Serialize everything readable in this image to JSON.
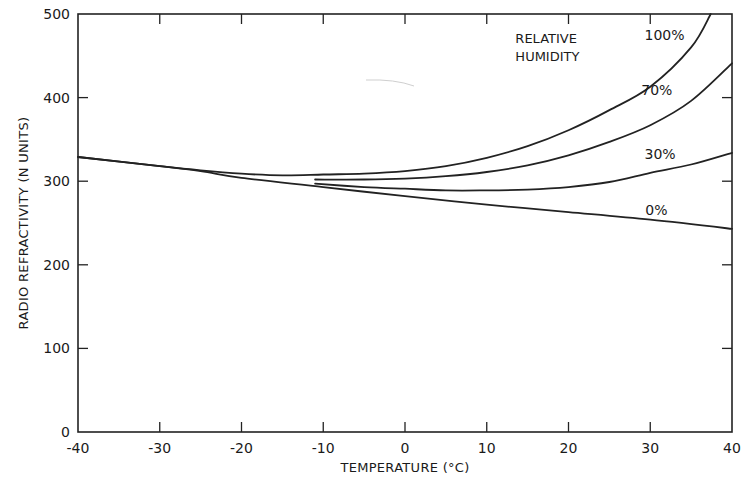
{
  "chart_data": {
    "type": "line",
    "title": "",
    "xlabel": "TEMPERATURE (°C)",
    "ylabel": "RADIO REFRACTIVITY (N UNITS)",
    "xlim": [
      -40,
      40
    ],
    "ylim": [
      0,
      500
    ],
    "x_ticks": [
      -40,
      -30,
      -20,
      -10,
      0,
      10,
      20,
      30,
      40
    ],
    "x_tick_labels": [
      "-40",
      "-30",
      "-20",
      "-10",
      "0",
      "10",
      "20",
      "30",
      "40"
    ],
    "y_ticks": [
      0,
      100,
      200,
      300,
      400,
      500
    ],
    "y_tick_labels": [
      "0",
      "100",
      "200",
      "300",
      "400",
      "500"
    ],
    "grid": false,
    "legend": {
      "title": "RELATIVE HUMIDITY",
      "title_lines": [
        "RELATIVE",
        "HUMIDITY"
      ],
      "position": "inline labels near curve ends (upper right)"
    },
    "series": [
      {
        "name": "100%",
        "label": "100%",
        "x": [
          -40,
          -30,
          -25,
          -20,
          -15,
          -10,
          -5,
          0,
          5,
          10,
          15,
          20,
          25,
          30,
          35,
          37.4
        ],
        "y": [
          329,
          318,
          313,
          309,
          307,
          308,
          309,
          312,
          318,
          328,
          342,
          361,
          385,
          413,
          460,
          500
        ]
      },
      {
        "name": "70%",
        "label": "70%",
        "x": [
          -11,
          -5,
          0,
          5,
          10,
          15,
          20,
          25,
          30,
          35,
          40
        ],
        "y": [
          302,
          302,
          303,
          306,
          311,
          319,
          331,
          347,
          367,
          396,
          441
        ]
      },
      {
        "name": "30%",
        "label": "30%",
        "x": [
          -11,
          -5,
          0,
          5,
          10,
          15,
          20,
          25,
          30,
          35,
          40
        ],
        "y": [
          297,
          293,
          291,
          289,
          289,
          290,
          293,
          299,
          310,
          320,
          334
        ]
      },
      {
        "name": "0%",
        "label": "0%",
        "x": [
          -40,
          -30,
          -25,
          -20,
          -10,
          0,
          10,
          20,
          30,
          40
        ],
        "y": [
          329,
          318,
          312,
          304,
          293,
          282,
          272,
          263,
          254,
          243
        ]
      }
    ],
    "annotations": [
      {
        "text": "RELATIVE",
        "x": 13.5,
        "y": 465
      },
      {
        "text": "HUMIDITY",
        "x": 13.5,
        "y": 444
      },
      {
        "text": "100%",
        "x": 29.3,
        "y": 469
      },
      {
        "text": "70%",
        "x": 28.9,
        "y": 403
      },
      {
        "text": "30%",
        "x": 29.3,
        "y": 326
      },
      {
        "text": "0%",
        "x": 29.4,
        "y": 260
      }
    ]
  },
  "layout_px": {
    "plot_left": 78,
    "plot_right": 732,
    "plot_top": 14,
    "plot_bottom": 432
  }
}
